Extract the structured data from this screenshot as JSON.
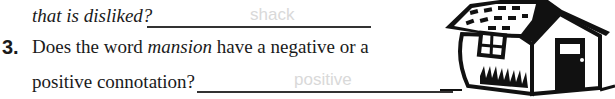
{
  "question2": {
    "continuation": "that is disliked?",
    "answer": "shack"
  },
  "question3": {
    "number": "3.",
    "text_before": "Does the word ",
    "emphasis": "mansion",
    "text_after": " have a negative or a",
    "line2": "positive connotation?",
    "answer": "positive"
  },
  "illustration": {
    "icon": "house-clipart-icon"
  }
}
